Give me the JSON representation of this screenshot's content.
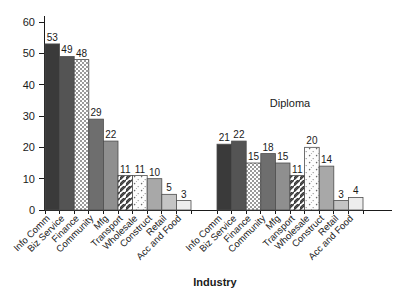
{
  "chart_data": {
    "type": "bar",
    "title": "",
    "xlabel": "Industry",
    "ylabel": "",
    "ylim": [
      0,
      60
    ],
    "yticks": [
      0,
      10,
      20,
      30,
      40,
      50,
      60
    ],
    "ytick_labels": [
      "0",
      "10",
      "20",
      "30",
      "40",
      "50",
      "60"
    ],
    "grid": false,
    "legend": "none",
    "group_labels": [
      "",
      "Diploma"
    ],
    "categories": [
      "Info Comm",
      "Biz Service",
      "Finance",
      "Community",
      "Mfg",
      "Transport",
      "Wholesale",
      "Construct",
      "Retail",
      "Acc and Food"
    ],
    "series": [
      {
        "name": "",
        "group_label": "",
        "values": [
          53,
          49,
          48,
          29,
          22,
          11,
          11,
          10,
          5,
          3
        ]
      },
      {
        "name": "Diploma",
        "group_label": "Diploma",
        "values": [
          21,
          22,
          15,
          18,
          15,
          11,
          20,
          14,
          3,
          4
        ]
      }
    ],
    "bar_styles": [
      {
        "category": "Info Comm",
        "fill": "#3a3a3a",
        "pattern": "solid"
      },
      {
        "category": "Biz Service",
        "fill": "#545454",
        "pattern": "solid"
      },
      {
        "category": "Finance",
        "fill": "#e8e8e8",
        "pattern": "checker"
      },
      {
        "category": "Community",
        "fill": "#6e6e6e",
        "pattern": "solid"
      },
      {
        "category": "Mfg",
        "fill": "#8f8f8f",
        "pattern": "solid"
      },
      {
        "category": "Transport",
        "fill": "#ffffff",
        "pattern": "diagonal-hatch"
      },
      {
        "category": "Wholesale",
        "fill": "#fbfbfb",
        "pattern": "dots"
      },
      {
        "category": "Construct",
        "fill": "#a8a8a8",
        "pattern": "solid"
      },
      {
        "category": "Retail",
        "fill": "#c4c4c4",
        "pattern": "solid"
      },
      {
        "category": "Acc and Food",
        "fill": "#ededed",
        "pattern": "solid"
      }
    ]
  },
  "axis": {
    "y_axis_name": "y-axis",
    "x_axis_name": "x-axis",
    "x_title": "Industry"
  }
}
